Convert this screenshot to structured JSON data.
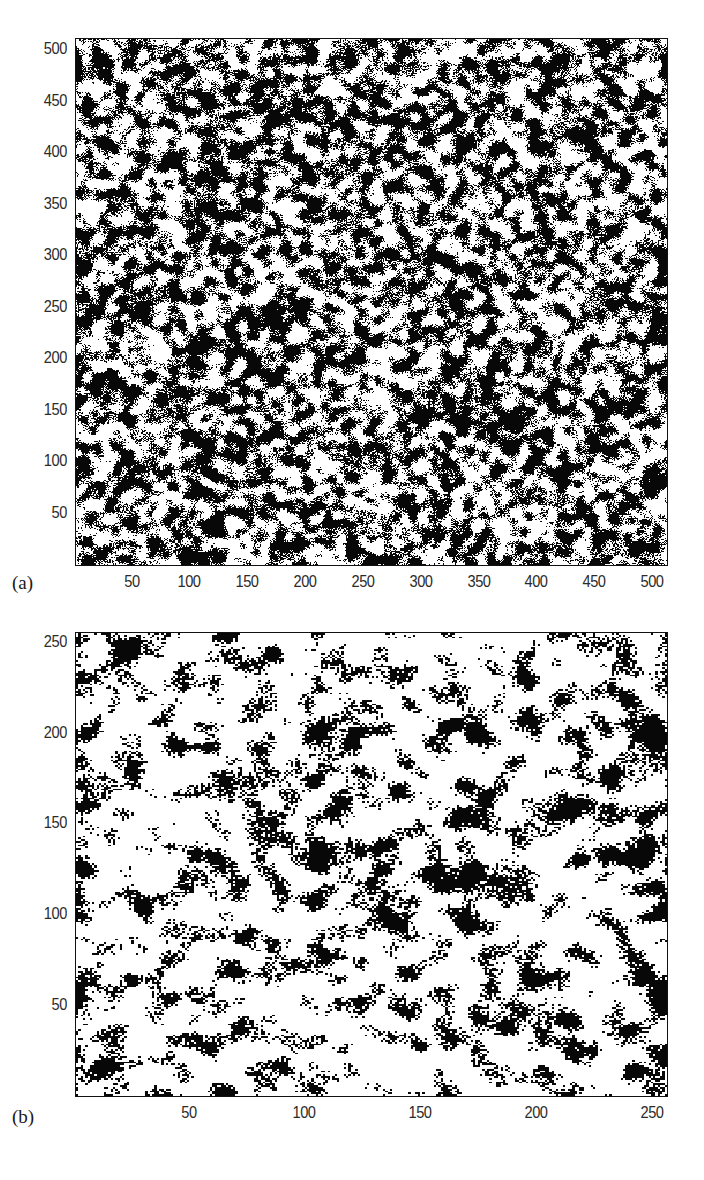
{
  "figure": {
    "background_color": "#ffffff",
    "ink_color": "#000000",
    "tick_label_color": "#2b2b2b"
  },
  "chart_data": [
    {
      "type": "heatmap",
      "panel_label": "(a)",
      "title": "",
      "xlabel": "",
      "ylabel": "",
      "description": "Binary black-and-white random noise field, 512 x 512 pixels, dense mottled texture with approximately 50 percent black coverage and fine-grained correlated blobs",
      "colormap": "binary (black and white)",
      "grid": false,
      "legend": null,
      "width_px": 512,
      "height_px": 512,
      "xlim": [
        1,
        512
      ],
      "ylim": [
        1,
        512
      ],
      "black_fraction": 0.5,
      "blob_scale": 3.0,
      "seed": 20240117,
      "xticks": [
        50,
        100,
        150,
        200,
        250,
        300,
        350,
        400,
        450,
        500
      ],
      "yticks": [
        50,
        100,
        150,
        200,
        250,
        300,
        350,
        400,
        450,
        500
      ],
      "xticklabels": [
        "50",
        "100",
        "150",
        "200",
        "250",
        "300",
        "350",
        "400",
        "450",
        "500"
      ],
      "yticklabels": [
        "50",
        "100",
        "150",
        "200",
        "250",
        "300",
        "350",
        "400",
        "450",
        "500"
      ]
    },
    {
      "type": "heatmap",
      "panel_label": "(b)",
      "title": "",
      "xlabel": "",
      "ylabel": "",
      "description": "Binary black-and-white random noise field, 256 x 256 pixels, sparser texture with approximately 25 percent black coverage and coarser clustered blobs on a white background",
      "colormap": "binary (black and white)",
      "grid": false,
      "legend": null,
      "width_px": 256,
      "height_px": 256,
      "xlim": [
        1,
        256
      ],
      "ylim": [
        1,
        256
      ],
      "black_fraction": 0.26,
      "blob_scale": 2.6,
      "seed": 77310244,
      "xticks": [
        50,
        100,
        150,
        200,
        250
      ],
      "yticks": [
        50,
        100,
        150,
        200,
        250
      ],
      "xticklabels": [
        "50",
        "100",
        "150",
        "200",
        "250"
      ],
      "yticklabels": [
        "50",
        "100",
        "150",
        "200",
        "250"
      ]
    }
  ]
}
